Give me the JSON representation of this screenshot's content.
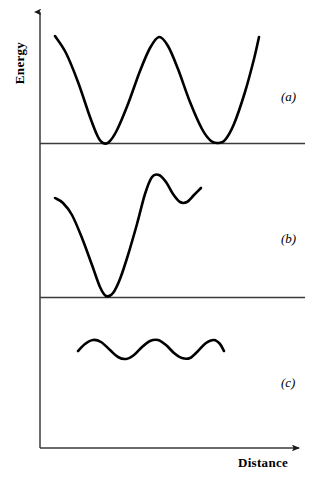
{
  "figure": {
    "background_color": "#ffffff",
    "line_color": "#000000",
    "axis_color": "#3a3a3a",
    "curve_stroke_width": 2.6,
    "axis_stroke_width": 1.4,
    "width": 316,
    "height": 481
  },
  "axes": {
    "y_label": "Energy",
    "x_label": "Distance",
    "y_axis_x": 40,
    "y_axis_top": 8,
    "x_axis_y": 448,
    "x_axis_right": 305,
    "arrowheads": [
      "y-axis-up",
      "x-axis-right"
    ]
  },
  "panels": [
    {
      "key": "a",
      "label": "(a)",
      "label_x": 281,
      "label_y": 89,
      "baseline_y": 143
    },
    {
      "key": "b",
      "label": "(b)",
      "label_x": 281,
      "label_y": 231,
      "baseline_y": 297
    },
    {
      "key": "c",
      "label": "(c)",
      "label_x": 281,
      "label_y": 375,
      "baseline_y": null
    }
  ],
  "dividers": [
    {
      "name": "divider-a-b",
      "y": 143,
      "x_start": 40,
      "x_end": 305
    },
    {
      "name": "divider-b-c",
      "y": 297,
      "x_start": 40,
      "x_end": 305
    }
  ],
  "chart_data": {
    "type": "line",
    "title": "",
    "xlabel": "Distance",
    "ylabel": "Energy",
    "grid": false,
    "legend": null,
    "axis_ticks": {
      "x": [],
      "y": []
    },
    "annotations": [
      "(a)",
      "(b)",
      "(c)"
    ],
    "series": [
      {
        "name": "(a) symmetric periodic double well",
        "panel": "a",
        "baseline_y": 143,
        "points": [
          {
            "x": 55,
            "y": 36
          },
          {
            "x": 66,
            "y": 53
          },
          {
            "x": 78,
            "y": 82
          },
          {
            "x": 90,
            "y": 117
          },
          {
            "x": 98,
            "y": 137
          },
          {
            "x": 103,
            "y": 143
          },
          {
            "x": 109,
            "y": 142
          },
          {
            "x": 117,
            "y": 130
          },
          {
            "x": 128,
            "y": 104
          },
          {
            "x": 140,
            "y": 71
          },
          {
            "x": 150,
            "y": 48
          },
          {
            "x": 159,
            "y": 37
          },
          {
            "x": 168,
            "y": 46
          },
          {
            "x": 178,
            "y": 69
          },
          {
            "x": 190,
            "y": 102
          },
          {
            "x": 202,
            "y": 129
          },
          {
            "x": 211,
            "y": 141
          },
          {
            "x": 218,
            "y": 143
          },
          {
            "x": 225,
            "y": 140
          },
          {
            "x": 234,
            "y": 124
          },
          {
            "x": 245,
            "y": 92
          },
          {
            "x": 254,
            "y": 59
          },
          {
            "x": 259,
            "y": 37
          }
        ],
        "features": {
          "minima": [
            {
              "x": 103,
              "y": 143
            },
            {
              "x": 218,
              "y": 143
            }
          ],
          "maxima": [
            {
              "x": 159,
              "y": 37
            }
          ],
          "endpoints_y": [
            36,
            37
          ]
        }
      },
      {
        "name": "(b) asymmetric deep and shallow wells",
        "panel": "b",
        "baseline_y": 297,
        "points": [
          {
            "x": 55,
            "y": 198
          },
          {
            "x": 63,
            "y": 203
          },
          {
            "x": 72,
            "y": 215
          },
          {
            "x": 82,
            "y": 238
          },
          {
            "x": 92,
            "y": 265
          },
          {
            "x": 100,
            "y": 287
          },
          {
            "x": 106,
            "y": 296
          },
          {
            "x": 113,
            "y": 293
          },
          {
            "x": 120,
            "y": 279
          },
          {
            "x": 128,
            "y": 255
          },
          {
            "x": 137,
            "y": 224
          },
          {
            "x": 145,
            "y": 194
          },
          {
            "x": 152,
            "y": 177
          },
          {
            "x": 159,
            "y": 175
          },
          {
            "x": 166,
            "y": 182
          },
          {
            "x": 173,
            "y": 194
          },
          {
            "x": 180,
            "y": 202
          },
          {
            "x": 187,
            "y": 202
          },
          {
            "x": 194,
            "y": 195
          },
          {
            "x": 201,
            "y": 188
          }
        ],
        "features": {
          "minima": [
            {
              "x": 106,
              "y": 296
            },
            {
              "x": 184,
              "y": 203
            }
          ],
          "maxima": [
            {
              "x": 156,
              "y": 175
            }
          ],
          "endpoints_y": [
            198,
            188
          ]
        }
      },
      {
        "name": "(c) shallow periodic ripple",
        "panel": "c",
        "baseline_y": null,
        "points": [
          {
            "x": 78,
            "y": 351
          },
          {
            "x": 85,
            "y": 344
          },
          {
            "x": 93,
            "y": 340
          },
          {
            "x": 101,
            "y": 342
          },
          {
            "x": 110,
            "y": 350
          },
          {
            "x": 118,
            "y": 357
          },
          {
            "x": 126,
            "y": 359
          },
          {
            "x": 134,
            "y": 355
          },
          {
            "x": 142,
            "y": 347
          },
          {
            "x": 150,
            "y": 341
          },
          {
            "x": 158,
            "y": 340
          },
          {
            "x": 166,
            "y": 345
          },
          {
            "x": 174,
            "y": 353
          },
          {
            "x": 182,
            "y": 358
          },
          {
            "x": 190,
            "y": 358
          },
          {
            "x": 198,
            "y": 351
          },
          {
            "x": 206,
            "y": 343
          },
          {
            "x": 214,
            "y": 340
          },
          {
            "x": 220,
            "y": 344
          },
          {
            "x": 224,
            "y": 351
          }
        ],
        "features": {
          "minima": [
            {
              "x": 126,
              "y": 359
            },
            {
              "x": 186,
              "y": 358
            }
          ],
          "maxima": [
            {
              "x": 94,
              "y": 340
            },
            {
              "x": 156,
              "y": 340
            },
            {
              "x": 215,
              "y": 340
            }
          ],
          "amplitude_px": 9,
          "period_px": 61
        }
      }
    ]
  }
}
